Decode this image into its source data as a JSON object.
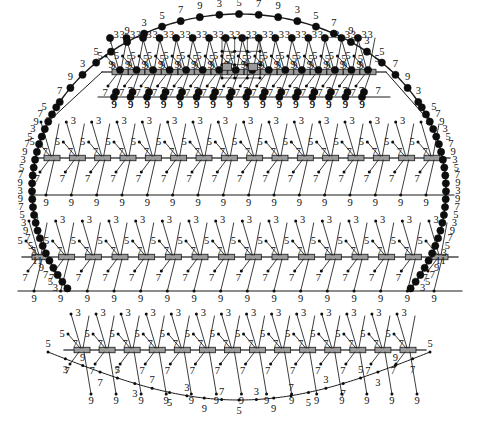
{
  "figure": {
    "type": "engineering-schematic",
    "width": 478,
    "height": 427,
    "colors": {
      "line": "#1a1a1a",
      "node": "#0d0d0d",
      "rail": "#4a4a4a",
      "block_fill": "#9a9a9a",
      "block_stroke": "#1a1a1a",
      "label": "#111111",
      "background": "#ffffff"
    },
    "label_vocabulary": [
      "3",
      "5",
      "7",
      "9",
      "11"
    ]
  },
  "outer_arc_top": {
    "name": "top-dome-arc",
    "node_style": "large-filled-circle",
    "labels": [
      "7",
      "9",
      "3",
      "5",
      "7",
      "9",
      "3",
      "5",
      "7",
      "9",
      "3",
      "5",
      "7",
      "9",
      "3",
      "5",
      "7",
      "9",
      "3",
      "5",
      "7",
      "9",
      "3"
    ]
  },
  "left_arc": {
    "name": "left-side-arc",
    "node_style": "large-filled-circle",
    "labels": [
      "5",
      "7",
      "9",
      "3",
      "5",
      "7",
      "9",
      "3",
      "5",
      "7",
      "9",
      "3",
      "9",
      "7",
      "5",
      "3",
      "9",
      "7",
      "5",
      "3",
      "11",
      "9",
      "7",
      "5",
      "3"
    ]
  },
  "right_arc": {
    "name": "right-side-arc",
    "node_style": "large-filled-circle",
    "labels": [
      "5",
      "7",
      "9",
      "3",
      "5",
      "7",
      "9",
      "3",
      "5",
      "7",
      "9",
      "3",
      "9",
      "7",
      "5",
      "3",
      "9",
      "7",
      "5",
      "3",
      "11",
      "9",
      "7",
      "5",
      "3"
    ]
  },
  "bottom_arc": {
    "name": "bottom-catenary-arc",
    "node_style": "small-dot",
    "labels": [
      "5",
      "3",
      "9",
      "7",
      "5",
      "3",
      "7",
      "5",
      "3",
      "9",
      "7",
      "5",
      "3",
      "9",
      "7",
      "5",
      "3",
      "7",
      "5",
      "3",
      "9",
      "7",
      "5"
    ]
  },
  "bands": [
    {
      "id": "band-1",
      "name": "upper-truss-band",
      "node_style": "large-filled-circle",
      "rail_label": "9",
      "upper_branch_label": "3",
      "mid_branch_label": "5",
      "lower_branch_label": "7",
      "bottom_chord_label": "9",
      "bay_count": 16,
      "has_detail_inset": true
    },
    {
      "id": "band-2",
      "name": "second-truss-band",
      "node_style": "small-dot",
      "rail_label": "7",
      "upper_branch_label": "3",
      "mid_branch_label": "5",
      "lower_branch_label": "7",
      "bottom_chord_label": "9",
      "bay_count": 16,
      "has_detail_inset": false
    },
    {
      "id": "band-3",
      "name": "third-truss-band",
      "node_style": "small-dot",
      "rail_label": "7",
      "upper_branch_label": "3",
      "mid_branch_label": "5",
      "lower_branch_label": "7",
      "bottom_chord_label": "9",
      "bay_count": 16,
      "has_detail_inset": false
    },
    {
      "id": "band-4",
      "name": "lower-truss-band",
      "node_style": "small-dot",
      "rail_label": "7",
      "upper_branch_label": "3",
      "mid_branch_label": "5",
      "lower_branch_label": "7",
      "bottom_chord_label": "9",
      "bay_count": 14,
      "has_detail_inset": false
    }
  ],
  "detail_inset": {
    "name": "center-detail-callout",
    "description": "Small orthogonal grid callout with two boxed sub-nodes at the apex centre of the upper band",
    "x": 222,
    "y": 38,
    "width": 38,
    "height": 40,
    "sub_boxes": 2
  },
  "chart_data": {
    "type": "scatter",
    "xlabel": "",
    "ylabel": "",
    "grid": false,
    "legend": null,
    "series": [
      {
        "name": "top-dome-arc",
        "values": [
          7,
          9,
          3,
          5,
          7,
          9,
          3,
          5,
          7,
          9,
          3,
          5,
          7,
          9,
          3,
          5,
          7,
          9,
          3,
          5,
          7,
          9,
          3
        ]
      },
      {
        "name": "left-side-arc",
        "values": [
          5,
          7,
          9,
          3,
          5,
          7,
          9,
          3,
          5,
          7,
          9,
          3,
          9,
          7,
          5,
          3,
          9,
          7,
          5,
          3,
          11,
          9,
          7,
          5,
          3
        ]
      },
      {
        "name": "right-side-arc",
        "values": [
          5,
          7,
          9,
          3,
          5,
          7,
          9,
          3,
          5,
          7,
          9,
          3,
          9,
          7,
          5,
          3,
          9,
          7,
          5,
          3,
          11,
          9,
          7,
          5,
          3
        ]
      },
      {
        "name": "bottom-catenary-arc",
        "values": [
          5,
          3,
          9,
          7,
          5,
          3,
          7,
          5,
          3,
          9,
          7,
          5,
          3,
          9,
          7,
          5,
          3,
          7,
          5,
          3,
          9,
          7,
          5
        ]
      },
      {
        "name": "band-1-branch-labels",
        "values": [
          3,
          5,
          7,
          9
        ]
      },
      {
        "name": "band-2-branch-labels",
        "values": [
          3,
          5,
          7,
          9
        ]
      },
      {
        "name": "band-3-branch-labels",
        "values": [
          3,
          5,
          7,
          9
        ]
      },
      {
        "name": "band-4-branch-labels",
        "values": [
          3,
          5,
          7,
          9
        ]
      }
    ]
  }
}
